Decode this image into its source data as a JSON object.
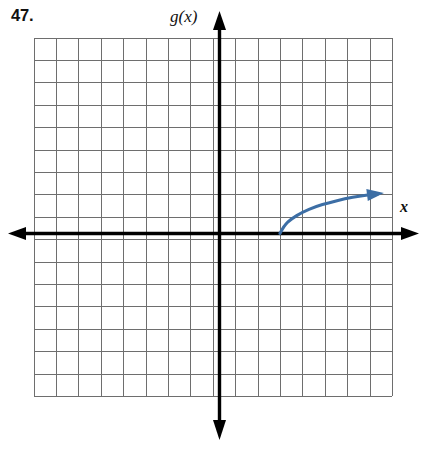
{
  "page": {
    "width": 422,
    "height": 466,
    "background": "#ffffff"
  },
  "problem": {
    "number_label": "47."
  },
  "labels": {
    "function_label": "g(x)",
    "x_axis_label": "x"
  },
  "colors": {
    "grid": "#6e6e6e",
    "axis": "#000000",
    "curve": "#3c6ea5",
    "text": "#111111"
  },
  "chart_data": {
    "type": "line",
    "title": "",
    "subtitle": "",
    "xlabel": "x",
    "ylabel": "g(x)",
    "grid": true,
    "legend": false,
    "grid_cells_x": 16,
    "grid_cells_y": 16,
    "cell_size_px": 22.4,
    "origin_cell": {
      "col": 8,
      "row": 8.75
    },
    "xlim": [
      -8,
      8
    ],
    "ylim": [
      -7.25,
      8.75
    ],
    "xticks": [
      -8,
      -7,
      -6,
      -5,
      -4,
      -3,
      -2,
      -1,
      0,
      1,
      2,
      3,
      4,
      5,
      6,
      7,
      8
    ],
    "yticks": [
      -7,
      -6,
      -5,
      -4,
      -3,
      -2,
      -1,
      0,
      1,
      2,
      3,
      4,
      5,
      6,
      7,
      8
    ],
    "tick_labels_shown": false,
    "series": [
      {
        "name": "g(x)",
        "description": "square-root shaped increasing curve starting on the x-axis at x=3 and rising to the right, ending with an arrowhead",
        "arrow_end": "right",
        "x": [
          3.0,
          3.2,
          3.5,
          4.0,
          4.6,
          5.2,
          5.9,
          6.6,
          7.4
        ],
        "y": [
          0.0,
          0.38,
          0.64,
          0.95,
          1.2,
          1.38,
          1.55,
          1.68,
          1.78
        ]
      }
    ],
    "annotations": [
      {
        "text": "g(x)",
        "position": "top of y-axis"
      },
      {
        "text": "x",
        "position": "right of x-axis"
      }
    ]
  }
}
